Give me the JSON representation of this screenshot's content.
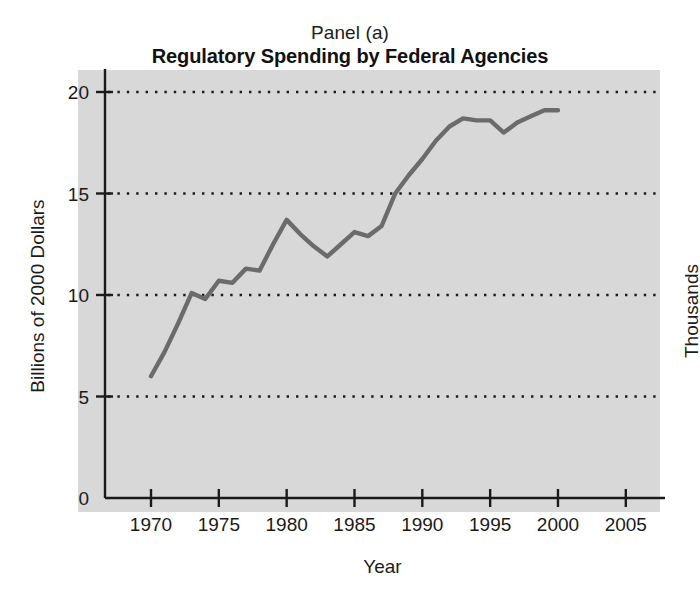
{
  "figure": {
    "panel_label": "Panel (a)",
    "right_side_label": "Thousands",
    "background_color": "#ffffff",
    "plot_background_color": "#d8d8d8",
    "line_color": "#6b6b6b",
    "axis_color": "#1a1a1a",
    "grid_color": "#1a1a1a"
  },
  "chart_data": {
    "type": "line",
    "title": "Regulatory Spending by Federal Agencies",
    "subtitle": "Panel (a)",
    "xlabel": "Year",
    "ylabel": "Billions of 2000 Dollars",
    "xlim": [
      1968,
      2008
    ],
    "ylim": [
      0,
      20
    ],
    "xticks": [
      1970,
      1975,
      1980,
      1985,
      1990,
      1995,
      2000,
      2005
    ],
    "xticklabels": [
      "1970",
      "1975",
      "1980",
      "1985",
      "1990",
      "1995",
      "2000",
      "2005"
    ],
    "yticks": [
      0,
      5,
      10,
      15,
      20
    ],
    "yticklabels": [
      "0",
      "5",
      "10",
      "15",
      "20"
    ],
    "grid": "horizontal-dotted",
    "grid_values": [
      5,
      10,
      15,
      20
    ],
    "legend": null,
    "series": [
      {
        "name": "Regulatory spending",
        "color": "#6b6b6b",
        "x": [
          1970,
          1971,
          1972,
          1973,
          1974,
          1975,
          1976,
          1977,
          1978,
          1979,
          1980,
          1981,
          1982,
          1983,
          1984,
          1985,
          1986,
          1987,
          1988,
          1989,
          1990,
          1991,
          1992,
          1993,
          1994,
          1995,
          1996,
          1997,
          1998,
          1999,
          2000
        ],
        "values": [
          6.0,
          7.2,
          8.6,
          10.1,
          9.8,
          10.7,
          10.6,
          11.3,
          11.2,
          12.5,
          13.7,
          13.0,
          12.4,
          11.9,
          12.5,
          13.1,
          12.9,
          13.4,
          15.0,
          15.9,
          16.7,
          17.6,
          18.3,
          18.7,
          18.6,
          18.6,
          18.0,
          18.5,
          18.8,
          19.1,
          19.1
        ]
      }
    ]
  }
}
